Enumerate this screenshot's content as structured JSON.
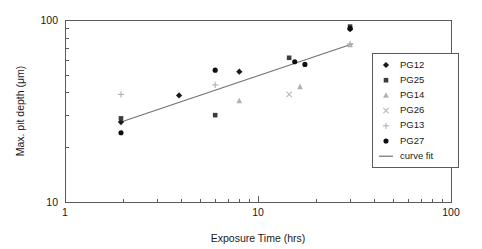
{
  "chart_data": {
    "type": "scatter",
    "title": "",
    "xlabel": "Exposure Time (hrs)",
    "ylabel": "Max. pit depth (μm)",
    "xscale": "log",
    "yscale": "log",
    "xlim": [
      1,
      100
    ],
    "ylim": [
      10,
      100
    ],
    "xticks": [
      1,
      10,
      100
    ],
    "xtick_labels": [
      "1",
      "10",
      "100"
    ],
    "yticks": [
      10,
      100
    ],
    "ytick_labels": [
      "10",
      "100"
    ],
    "grid": false,
    "legend_position": "right",
    "series": [
      {
        "name": "PG12",
        "marker": "diamond",
        "color": "#1a1a1a",
        "points": [
          {
            "x": 1.95,
            "y": 27.5
          },
          {
            "x": 3.9,
            "y": 38.5
          },
          {
            "x": 8.0,
            "y": 52.0
          },
          {
            "x": 30.0,
            "y": 89.0
          }
        ]
      },
      {
        "name": "PG25",
        "marker": "square",
        "color": "#3c3c3c",
        "points": [
          {
            "x": 1.95,
            "y": 28.8
          },
          {
            "x": 6.0,
            "y": 30.0
          },
          {
            "x": 14.5,
            "y": 62.0
          },
          {
            "x": 30.0,
            "y": 92.0
          }
        ]
      },
      {
        "name": "PG14",
        "marker": "triangle",
        "color": "#b0b0b0",
        "points": [
          {
            "x": 8.0,
            "y": 36.0
          },
          {
            "x": 16.5,
            "y": 43.0
          },
          {
            "x": 30.0,
            "y": 73.0
          }
        ]
      },
      {
        "name": "PG26",
        "marker": "cross-x",
        "color": "#b8b8b8",
        "points": [
          {
            "x": 14.5,
            "y": 39.0
          }
        ]
      },
      {
        "name": "PG13",
        "marker": "plus",
        "color": "#b0b0b0",
        "points": [
          {
            "x": 1.95,
            "y": 39.0
          },
          {
            "x": 6.0,
            "y": 44.0
          },
          {
            "x": 30.0,
            "y": 74.0
          }
        ]
      },
      {
        "name": "PG27",
        "marker": "circle",
        "color": "#0d0d0d",
        "points": [
          {
            "x": 1.95,
            "y": 24.0
          },
          {
            "x": 6.0,
            "y": 53.0
          },
          {
            "x": 15.5,
            "y": 59.0
          },
          {
            "x": 17.5,
            "y": 57.0
          },
          {
            "x": 30.0,
            "y": 90.0
          }
        ]
      }
    ],
    "fit": {
      "name": "curve fit",
      "color": "#707070",
      "x_start": 1.95,
      "y_start": 27.5,
      "x_end": 31.0,
      "y_end": 74.0
    },
    "legend_entries": [
      {
        "label": "PG12",
        "marker": "diamond",
        "color": "#1a1a1a"
      },
      {
        "label": "PG25",
        "marker": "square",
        "color": "#3c3c3c"
      },
      {
        "label": "PG14",
        "marker": "triangle",
        "color": "#b0b0b0"
      },
      {
        "label": "PG26",
        "marker": "cross-x",
        "color": "#b8b8b8"
      },
      {
        "label": "PG13",
        "marker": "plus",
        "color": "#b0b0b0"
      },
      {
        "label": "PG27",
        "marker": "circle",
        "color": "#0d0d0d"
      },
      {
        "label": "curve fit",
        "marker": "line",
        "color": "#707070"
      }
    ]
  }
}
